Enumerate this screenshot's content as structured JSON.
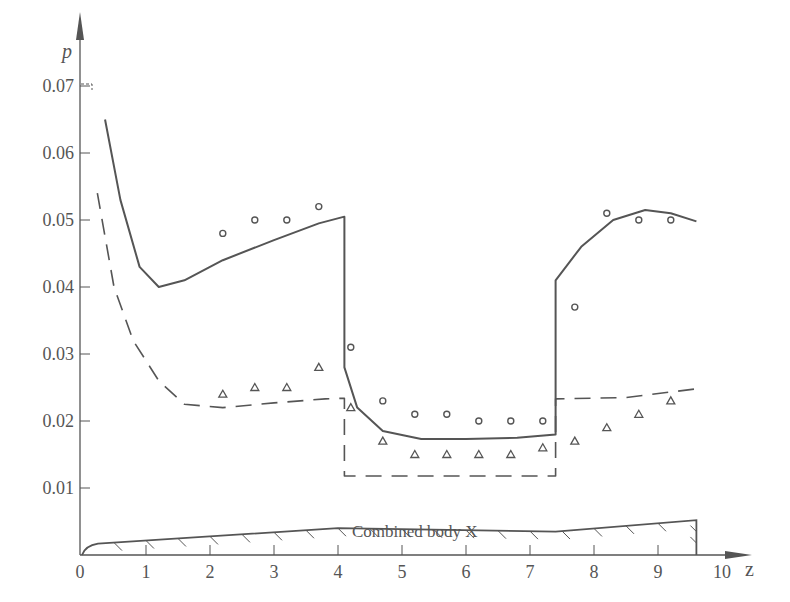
{
  "chart_data": {
    "type": "line",
    "title": "",
    "xlabel": "z",
    "ylabel": "p",
    "xlim": [
      0,
      10
    ],
    "ylim": [
      0,
      0.07
    ],
    "x_ticks": [
      "0",
      "1",
      "2",
      "3",
      "4",
      "5",
      "6",
      "7",
      "8",
      "9",
      "10"
    ],
    "y_ticks": [
      "0.01",
      "0.02",
      "0.03",
      "0.04",
      "0.05",
      "0.06",
      "0.07"
    ],
    "grid": false,
    "annotation": "Combined body X",
    "series": [
      {
        "name": "solid curve (theory, upper)",
        "style": "solid",
        "points": [
          [
            0.36,
            0.065
          ],
          [
            0.6,
            0.053
          ],
          [
            0.9,
            0.043
          ],
          [
            1.2,
            0.04
          ],
          [
            1.6,
            0.041
          ],
          [
            2.2,
            0.044
          ],
          [
            3.0,
            0.047
          ],
          [
            3.7,
            0.0495
          ],
          [
            4.1,
            0.0505
          ],
          [
            4.1,
            0.028
          ],
          [
            4.3,
            0.022
          ],
          [
            4.7,
            0.0185
          ],
          [
            5.3,
            0.0173
          ],
          [
            6.0,
            0.0173
          ],
          [
            6.8,
            0.0175
          ],
          [
            7.4,
            0.018
          ],
          [
            7.4,
            0.041
          ],
          [
            7.8,
            0.046
          ],
          [
            8.3,
            0.05
          ],
          [
            8.8,
            0.0515
          ],
          [
            9.2,
            0.051
          ],
          [
            9.6,
            0.0498
          ]
        ]
      },
      {
        "name": "dashed curve (theory, lower)",
        "style": "dashed",
        "points": [
          [
            0.24,
            0.054
          ],
          [
            0.5,
            0.04
          ],
          [
            0.8,
            0.032
          ],
          [
            1.2,
            0.026
          ],
          [
            1.6,
            0.0225
          ],
          [
            2.2,
            0.022
          ],
          [
            3.0,
            0.0227
          ],
          [
            3.8,
            0.0233
          ],
          [
            4.1,
            0.0234
          ],
          [
            4.1,
            0.0118
          ],
          [
            7.4,
            0.0118
          ],
          [
            7.4,
            0.0233
          ],
          [
            8.5,
            0.0235
          ],
          [
            9.6,
            0.0248
          ]
        ]
      },
      {
        "name": "circles (experiment)",
        "style": "marker-circle",
        "points": [
          [
            2.2,
            0.048
          ],
          [
            2.7,
            0.05
          ],
          [
            3.2,
            0.05
          ],
          [
            3.7,
            0.052
          ],
          [
            4.2,
            0.031
          ],
          [
            4.7,
            0.023
          ],
          [
            5.2,
            0.021
          ],
          [
            5.7,
            0.021
          ],
          [
            6.2,
            0.02
          ],
          [
            6.7,
            0.02
          ],
          [
            7.2,
            0.02
          ],
          [
            7.7,
            0.037
          ],
          [
            8.2,
            0.051
          ],
          [
            8.7,
            0.05
          ],
          [
            9.2,
            0.05
          ]
        ]
      },
      {
        "name": "triangles (experiment)",
        "style": "marker-triangle",
        "points": [
          [
            2.2,
            0.024
          ],
          [
            2.7,
            0.025
          ],
          [
            3.2,
            0.025
          ],
          [
            3.7,
            0.028
          ],
          [
            4.2,
            0.022
          ],
          [
            4.7,
            0.017
          ],
          [
            5.2,
            0.015
          ],
          [
            5.7,
            0.015
          ],
          [
            6.2,
            0.015
          ],
          [
            6.7,
            0.015
          ],
          [
            7.2,
            0.016
          ],
          [
            7.7,
            0.017
          ],
          [
            8.2,
            0.019
          ],
          [
            8.7,
            0.021
          ],
          [
            9.2,
            0.023
          ]
        ]
      }
    ],
    "body_profile": [
      [
        0,
        0
      ],
      [
        0.25,
        0.0017
      ],
      [
        4.0,
        0.004
      ],
      [
        7.4,
        0.0035
      ],
      [
        9.6,
        0.0052
      ],
      [
        9.6,
        0
      ]
    ]
  },
  "labels": {
    "y_axis": "p",
    "x_axis": "z",
    "body": "Combined body X",
    "origin": "0"
  },
  "colors": {
    "ink": "#555555",
    "background": "#ffffff"
  }
}
